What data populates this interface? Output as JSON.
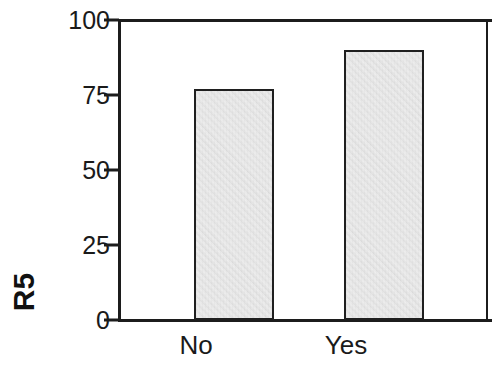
{
  "chart_data": {
    "type": "bar",
    "title": "",
    "xlabel": "",
    "ylabel": "R5",
    "categories": [
      "No",
      "Yes"
    ],
    "values": [
      77,
      90
    ],
    "ylim": [
      0,
      100
    ],
    "yticks": [
      "0",
      "25",
      "50",
      "75",
      "100"
    ],
    "ytick_values": [
      0,
      25,
      50,
      75,
      100
    ],
    "grid": false,
    "legend": null,
    "series": [
      {
        "name": "R5",
        "values": [
          77,
          90
        ]
      }
    ],
    "bar_fill_color": "#e4e4e4",
    "bar_edge_color": "#1f1f1f",
    "axis_color": "#1c1c1c",
    "background_color": "#ffffff"
  },
  "axis": {
    "y_title": "R5",
    "ticks": [
      {
        "label": "100",
        "value": 100
      },
      {
        "label": "75",
        "value": 75
      },
      {
        "label": "50",
        "value": 50
      },
      {
        "label": "25",
        "value": 25
      },
      {
        "label": "0",
        "value": 0
      }
    ]
  },
  "bars": [
    {
      "category": "No",
      "value": 77
    },
    {
      "category": "Yes",
      "value": 90
    }
  ]
}
